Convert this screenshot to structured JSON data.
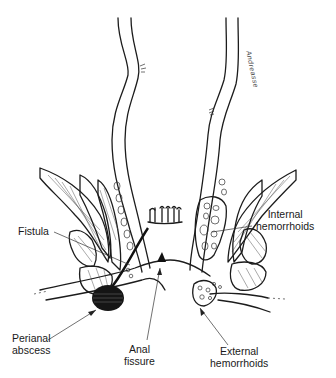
{
  "diagram": {
    "signature": "Andreasse",
    "labels": {
      "fistula": "Fistula",
      "internal_hemorrhoids_line1": "Internal",
      "internal_hemorrhoids_line2": "hemorrhoids",
      "perianal_abscess_line1": "Perianal",
      "perianal_abscess_line2": "abscess",
      "anal_fissure_line1": "Anal",
      "anal_fissure_line2": "fissure",
      "external_hemorrhoids_line1": "External",
      "external_hemorrhoids_line2": "hemorrhoids"
    },
    "colors": {
      "ink": "#1c1c1c",
      "background": "#ffffff"
    }
  }
}
